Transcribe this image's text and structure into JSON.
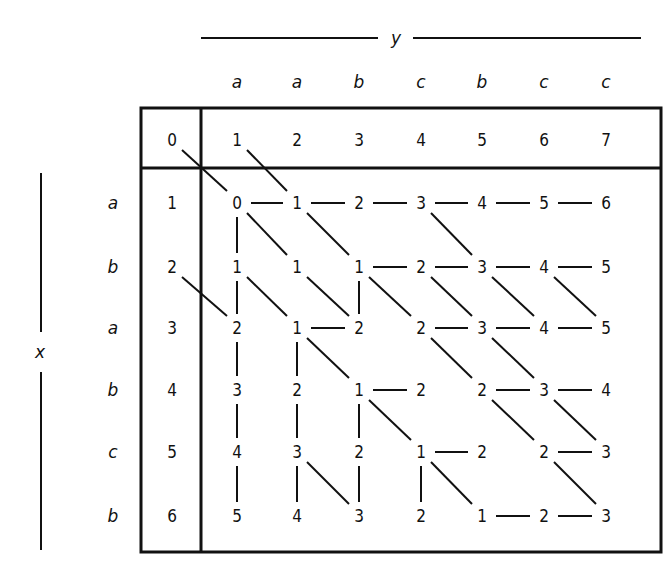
{
  "diagram": {
    "type": "edit-distance-matrix",
    "y_axis_label": "y",
    "x_axis_label": "x",
    "y_sequence": [
      "a",
      "a",
      "b",
      "c",
      "b",
      "c",
      "c"
    ],
    "x_sequence": [
      "a",
      "b",
      "a",
      "b",
      "c",
      "b"
    ],
    "header_row": [
      "0",
      "1",
      "2",
      "3",
      "4",
      "5",
      "6",
      "7"
    ],
    "row_index": [
      "1",
      "2",
      "3",
      "4",
      "5",
      "6"
    ],
    "matrix": [
      [
        "0",
        "1",
        "2",
        "3",
        "4",
        "5",
        "6"
      ],
      [
        "1",
        "1",
        "1",
        "2",
        "3",
        "4",
        "5"
      ],
      [
        "2",
        "1",
        "2",
        "2",
        "3",
        "4",
        "5"
      ],
      [
        "3",
        "2",
        "1",
        "2",
        "2",
        "3",
        "4"
      ],
      [
        "4",
        "3",
        "2",
        "1",
        "2",
        "2",
        "3"
      ],
      [
        "5",
        "4",
        "3",
        "2",
        "1",
        "2",
        "3"
      ]
    ],
    "edges": {
      "horizontal": [
        [
          0,
          0
        ],
        [
          0,
          1
        ],
        [
          0,
          2
        ],
        [
          0,
          3
        ],
        [
          0,
          4
        ],
        [
          0,
          5
        ],
        [
          1,
          2
        ],
        [
          1,
          3
        ],
        [
          1,
          4
        ],
        [
          1,
          5
        ],
        [
          2,
          1
        ],
        [
          2,
          3
        ],
        [
          2,
          4
        ],
        [
          2,
          5
        ],
        [
          3,
          2
        ],
        [
          3,
          4
        ],
        [
          3,
          5
        ],
        [
          4,
          3
        ],
        [
          4,
          5
        ],
        [
          5,
          4
        ],
        [
          5,
          5
        ]
      ],
      "vertical": [
        [
          0,
          0
        ],
        [
          1,
          0
        ],
        [
          1,
          2
        ],
        [
          2,
          0
        ],
        [
          2,
          1
        ],
        [
          3,
          0
        ],
        [
          3,
          1
        ],
        [
          3,
          2
        ],
        [
          4,
          0
        ],
        [
          4,
          1
        ],
        [
          4,
          2
        ],
        [
          4,
          3
        ]
      ],
      "diagonal": [
        [
          0,
          0
        ],
        [
          0,
          1
        ],
        [
          0,
          3
        ],
        [
          1,
          0
        ],
        [
          1,
          1
        ],
        [
          1,
          2
        ],
        [
          1,
          3
        ],
        [
          1,
          4
        ],
        [
          1,
          5
        ],
        [
          2,
          1
        ],
        [
          2,
          3
        ],
        [
          2,
          4
        ],
        [
          3,
          2
        ],
        [
          3,
          4
        ],
        [
          3,
          5
        ],
        [
          4,
          1
        ],
        [
          4,
          3
        ],
        [
          4,
          5
        ]
      ],
      "header_diagonal": [
        {
          "from": "header-0",
          "to": [
            0,
            0
          ]
        },
        {
          "from": "header-1",
          "to": [
            0,
            1
          ]
        },
        {
          "from": "index-2",
          "to": [
            2,
            0
          ]
        }
      ]
    }
  }
}
